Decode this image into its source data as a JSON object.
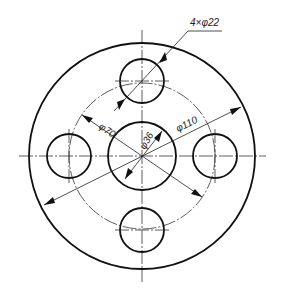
{
  "drawing": {
    "type": "flange-plate",
    "units": "mm",
    "dimensions": {
      "outer_diameter": {
        "label": "φ110",
        "value": 110
      },
      "bolt_circle_diameter": {
        "label": "φ70",
        "value": 70
      },
      "center_hole_diameter": {
        "label": "φ36",
        "value": 36
      },
      "bolt_holes": {
        "label": "4×φ22",
        "count": 4,
        "diameter": 22
      }
    },
    "colors": {
      "line": "#111111",
      "background": "#ffffff"
    }
  }
}
